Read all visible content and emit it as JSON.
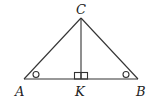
{
  "diagram": {
    "type": "geometry-triangle",
    "points": {
      "C": {
        "label": "C",
        "x": 81,
        "y": 18
      },
      "A": {
        "label": "A",
        "x": 24,
        "y": 79
      },
      "B": {
        "label": "B",
        "x": 138,
        "y": 79
      },
      "K": {
        "label": "K",
        "x": 81,
        "y": 79
      }
    },
    "segments": [
      "CA",
      "CB",
      "AB",
      "CK"
    ],
    "markers": {
      "right_angle_at": "K",
      "equal_angle_marks": [
        "A",
        "B"
      ]
    },
    "colors": {
      "stroke": "#333333",
      "text": "#222222",
      "background": "#ffffff"
    }
  }
}
